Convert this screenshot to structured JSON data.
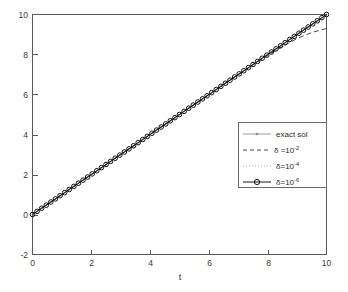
{
  "figure": {
    "width": 348,
    "height": 292,
    "background_color": "#ffffff"
  },
  "chart_data": {
    "type": "line",
    "title": "",
    "xlabel": "t",
    "ylabel": "",
    "xlim": [
      0,
      10
    ],
    "ylim": [
      -2,
      10
    ],
    "xticks": [
      0,
      2,
      4,
      6,
      8,
      10
    ],
    "yticks": [
      -2,
      0,
      2,
      4,
      6,
      8,
      10
    ],
    "xticklabels": [
      "0",
      "2",
      "4",
      "6",
      "8",
      "10"
    ],
    "yticklabels": [
      "-2",
      "0",
      "2",
      "4",
      "6",
      "8",
      "10"
    ],
    "grid": false,
    "legend_position": "center-right",
    "x": [
      0,
      0.5,
      1,
      1.5,
      2,
      2.5,
      3,
      3.5,
      4,
      4.5,
      5,
      5.5,
      6,
      6.5,
      7,
      7.5,
      8,
      8.5,
      9,
      9.5,
      10
    ],
    "series": [
      {
        "name": "exact sol",
        "linestyle": "solid",
        "marker": "dot",
        "color": "#8f8f8f",
        "values": [
          0,
          0.5,
          1,
          1.5,
          2,
          2.5,
          3,
          3.5,
          4,
          4.5,
          5,
          5.5,
          6,
          6.5,
          7,
          7.5,
          8,
          8.5,
          9,
          9.5,
          10
        ]
      },
      {
        "name": "delta = 10^-2",
        "linestyle": "dashed",
        "marker": "none",
        "color": "#4a4a4a",
        "values": [
          0,
          0.5,
          1,
          1.5,
          2,
          2.5,
          3,
          3.5,
          4,
          4.5,
          5,
          5.5,
          6,
          6.5,
          7,
          7.48,
          7.95,
          8.4,
          8.8,
          9.1,
          9.3
        ]
      },
      {
        "name": "delta = 10^-4",
        "linestyle": "dotted",
        "marker": "none",
        "color": "#a8a8a8",
        "values": [
          0,
          0.5,
          1,
          1.5,
          2,
          2.5,
          3,
          3.5,
          4,
          4.5,
          5,
          5.5,
          6,
          6.5,
          7,
          7.5,
          8,
          8.5,
          9,
          9.48,
          9.92
        ]
      },
      {
        "name": "delta = 10^-6",
        "linestyle": "solid",
        "marker": "circle",
        "color": "#1a1a1a",
        "values": [
          0,
          0.5,
          1,
          1.5,
          2,
          2.5,
          3,
          3.5,
          4,
          4.5,
          5,
          5.5,
          6,
          6.5,
          7,
          7.5,
          8,
          8.5,
          9,
          9.5,
          10
        ]
      }
    ]
  },
  "legend": {
    "entries": [
      {
        "label": "exact sol",
        "base": "exact sol",
        "sup": "",
        "style": "solid-light-dot"
      },
      {
        "label": "δ =10",
        "base": "δ =10",
        "sup": "-2",
        "style": "dashed"
      },
      {
        "label": "δ=10",
        "base": "δ=10",
        "sup": "-4",
        "style": "dotted"
      },
      {
        "label": "δ=10",
        "base": "δ=10",
        "sup": "-6",
        "style": "solid-dark-circle"
      }
    ]
  },
  "axes": {
    "xlabel": "t",
    "x_tick_0": "0",
    "x_tick_1": "2",
    "x_tick_2": "4",
    "x_tick_3": "6",
    "x_tick_4": "8",
    "x_tick_5": "10",
    "y_tick_0": "10",
    "y_tick_1": "8",
    "y_tick_2": "6",
    "y_tick_3": "4",
    "y_tick_4": "2",
    "y_tick_5": "0",
    "y_tick_6": "-2"
  }
}
